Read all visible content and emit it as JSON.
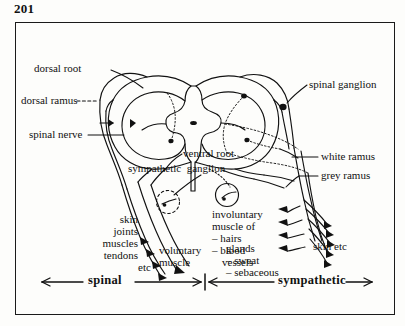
{
  "page": {
    "number": "201",
    "figure_title": "spinal cord cross-section with spinal and sympathetic nerve pathways"
  },
  "colors": {
    "ink": "#111111",
    "frame": "#1a1a1a",
    "paper": "#fdfdfb"
  },
  "labels": {
    "dorsal_root": "dorsal root",
    "dorsal_ramus": "dorsal ramus",
    "spinal_nerve": "spinal nerve",
    "ventral_root": "ventral root",
    "sympathetic_ganglion": "sympathetic  ganglion",
    "spinal_ganglion": "spinal ganglion",
    "white_ramus": "white ramus",
    "grey_ramus": "grey ramus",
    "skin_etc_right": "skin etc",
    "voluntary_muscle": "voluntary\nmuscle",
    "somatic_targets_line1": "skin",
    "somatic_targets_line2": "joints",
    "somatic_targets_line3": "muscles",
    "somatic_targets_line4": "tendons",
    "somatic_targets_line5": "etc",
    "involuntary_muscle_line1": "involuntary",
    "involuntary_muscle_line2": "muscle of",
    "involuntary_muscle_line3": "– hairs",
    "involuntary_muscle_line4": "– blood",
    "involuntary_muscle_line5": "vessels",
    "glands_line1": "glands",
    "glands_line2": "– sweat",
    "glands_line3": "– sebaceous"
  },
  "footer_bar": {
    "left_label": "spinal",
    "right_label": "sympathetic"
  }
}
